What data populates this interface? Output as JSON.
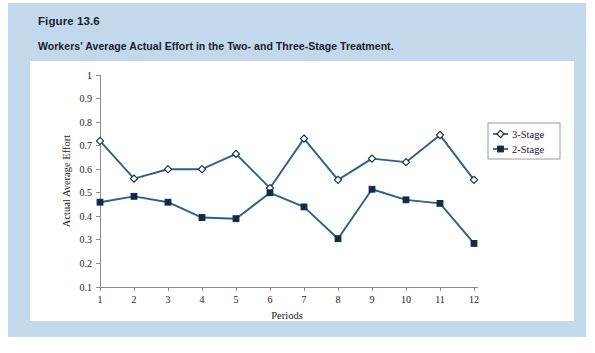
{
  "figure": {
    "number": "Figure 13.6",
    "title": "Workers' Average Actual Effort in the Two- and Three-Stage Treatment."
  },
  "colors": {
    "card_background": "#c3d8ea",
    "panel_background": "#ffffff",
    "series_line": "#2f5f8c",
    "marker_stroke": "#13293d",
    "axis": "#8c8c8c"
  },
  "chart_data": {
    "type": "line",
    "title": "Workers' Average Actual Effort in the Two- and Three-Stage Treatment.",
    "xlabel": "Periods",
    "ylabel": "Actual Average Effort",
    "x": [
      1,
      2,
      3,
      4,
      5,
      6,
      7,
      8,
      9,
      10,
      11,
      12
    ],
    "categories": [
      "1",
      "2",
      "3",
      "4",
      "5",
      "6",
      "7",
      "8",
      "9",
      "10",
      "11",
      "12"
    ],
    "xlim": [
      1,
      12
    ],
    "ylim": [
      0.1,
      1
    ],
    "yticks": [
      0.1,
      0.2,
      0.3,
      0.4,
      0.5,
      0.6,
      0.7,
      0.8,
      0.9,
      1
    ],
    "ytick_labels": [
      "0.1",
      "0.2",
      "0.3",
      "0.4",
      "0.5",
      "0.6",
      "0.7",
      "0.8",
      "0.9",
      "1"
    ],
    "grid": false,
    "legend_position": "right",
    "series": [
      {
        "name": "3-Stage",
        "marker": "diamond-open",
        "values": [
          0.72,
          0.56,
          0.6,
          0.6,
          0.665,
          0.52,
          0.73,
          0.555,
          0.645,
          0.63,
          0.745,
          0.555
        ]
      },
      {
        "name": "2-Stage",
        "marker": "square-filled",
        "values": [
          0.46,
          0.485,
          0.46,
          0.395,
          0.39,
          0.5,
          0.44,
          0.305,
          0.515,
          0.47,
          0.455,
          0.285
        ]
      }
    ]
  },
  "legend": {
    "items": [
      {
        "label": "3-Stage",
        "marker": "diamond-open"
      },
      {
        "label": "2-Stage",
        "marker": "square-filled"
      }
    ]
  }
}
